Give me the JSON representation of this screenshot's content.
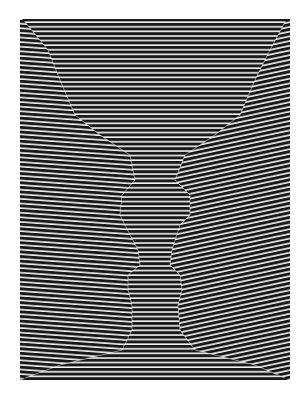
{
  "artwork": {
    "description": "Op-art figure-ground illusion: black and white horizontal stripes forming a central vase shape with two facing profiles",
    "colors": {
      "stripe_dark": "#1a1a1a",
      "stripe_light": "#f2f2f2",
      "background": "#ffffff"
    },
    "frame": {
      "x": 20,
      "y": 19,
      "width": 270,
      "height": 361
    },
    "stripe_period_px": 4.6
  }
}
